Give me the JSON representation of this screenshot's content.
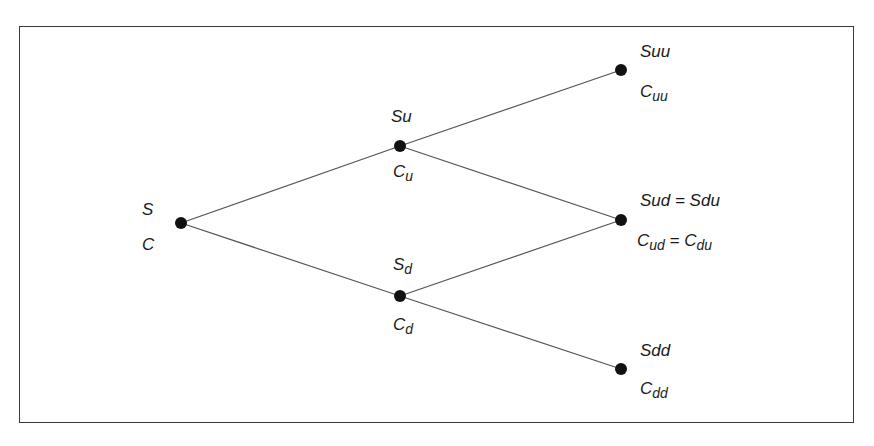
{
  "diagram": {
    "type": "binomial-tree",
    "colors": {
      "line": "#555555",
      "node": "#111111",
      "border": "#3a3a3a",
      "text": "#1a1a1a"
    },
    "nodes": [
      {
        "id": "root",
        "x": 181,
        "y": 223,
        "top": {
          "base": "S",
          "sub": ""
        },
        "bottom": {
          "base": "C",
          "sub": ""
        }
      },
      {
        "id": "u",
        "x": 400,
        "y": 146,
        "top": {
          "base": "Su",
          "sub": ""
        },
        "bottom": {
          "base": "C",
          "sub": "u"
        }
      },
      {
        "id": "d",
        "x": 400,
        "y": 296,
        "top": {
          "base": "S",
          "sub": "d"
        },
        "bottom": {
          "base": "C",
          "sub": "d"
        }
      },
      {
        "id": "uu",
        "x": 621,
        "y": 70,
        "top": {
          "base": "Suu",
          "sub": ""
        },
        "bottom": {
          "base": "C",
          "sub": "uu"
        }
      },
      {
        "id": "ud",
        "x": 621,
        "y": 220,
        "top": {
          "base": "Sud = Sdu",
          "sub": ""
        },
        "bottom": {
          "base": "C",
          "sub": "ud",
          "suffix": " = C",
          "suffix_sub": "du"
        }
      },
      {
        "id": "dd",
        "x": 621,
        "y": 369,
        "top": {
          "base": "Sdd",
          "sub": ""
        },
        "bottom": {
          "base": "C",
          "sub": "dd"
        }
      }
    ],
    "edges": [
      [
        "root",
        "u"
      ],
      [
        "root",
        "d"
      ],
      [
        "u",
        "uu"
      ],
      [
        "u",
        "ud"
      ],
      [
        "d",
        "ud"
      ],
      [
        "d",
        "dd"
      ]
    ]
  }
}
